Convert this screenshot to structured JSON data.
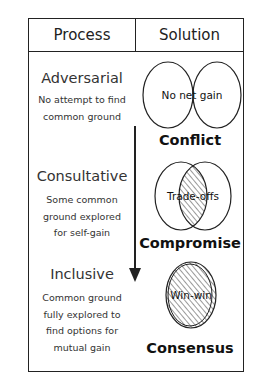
{
  "header": {
    "process_label": "Process",
    "solution_label": "Solution"
  },
  "rows": [
    {
      "process": "Adversarial",
      "description": [
        "No attempt to find",
        "common ground"
      ],
      "diagram_label": "No net gain",
      "diagram_type": "separate-circles",
      "solution": "Conflict"
    },
    {
      "process": "Consultative",
      "description": [
        "Some common",
        "ground explored",
        "for self-gain"
      ],
      "diagram_label": "Trade-offs",
      "diagram_type": "overlapping-circles",
      "solution": "Compromise"
    },
    {
      "process": "Inclusive",
      "description": [
        "Common ground",
        "fully explored to",
        "find options for",
        "mutual gain"
      ],
      "diagram_label": "Win-win",
      "diagram_type": "merged-circle",
      "solution": "Consensus"
    }
  ],
  "arrow": {
    "direction": "down",
    "meaning": "progression"
  },
  "colors": {
    "stroke": "#222222",
    "text": "#333333",
    "background": "#ffffff"
  }
}
